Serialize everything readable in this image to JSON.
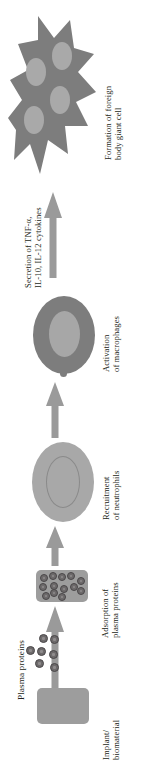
{
  "figure": {
    "orientation": "rotated-90-ccw",
    "background_color": "#ffffff",
    "text_color": "#231f20",
    "arrow_color": "#9a9a9a"
  },
  "side_labels": [
    {
      "name": "plasma-proteins",
      "lines": [
        "Plasma proteins"
      ]
    }
  ],
  "stages": [
    {
      "id": "implant",
      "lines": [
        "Implant/",
        "biomaterial"
      ],
      "shape": "rounded-rectangle",
      "color": "#9d9d9d"
    },
    {
      "id": "adsorption",
      "lines": [
        "Adsorption of",
        "plasma proteins"
      ],
      "shape": "rounded-rectangle-with-proteins",
      "color": "#9d9d9d"
    },
    {
      "id": "recruitment",
      "lines": [
        "Recruitment",
        "of neutrophils"
      ],
      "shape": "oval-cell",
      "color": "#a8a8a8"
    },
    {
      "id": "activation",
      "lines": [
        "Activation",
        "of macrophages"
      ],
      "shape": "oval-cell",
      "color": "#7d7d7d"
    },
    {
      "id": "secretion",
      "lines": [
        "Secretion of TNF-α,",
        "IL-10, IL-12 cytokines"
      ],
      "shape": "arrow-annotation",
      "color": "#231f20"
    },
    {
      "id": "giant-cell",
      "lines": [
        "Formation of foreign",
        "body giant cell"
      ],
      "shape": "star-polygon",
      "color": "#7d7d7d"
    }
  ],
  "arrows": {
    "count": 5,
    "direction": "upward",
    "color": "#9a9a9a"
  },
  "protein_dots": {
    "free_count": 7,
    "adsorbed_count": 13,
    "fill": "#6d6a6b",
    "stroke": "#4a4749"
  },
  "giant_cell": {
    "nuclei_count": 4,
    "body_color": "#7d7d7d",
    "nucleus_color": "#a9a9a9"
  }
}
